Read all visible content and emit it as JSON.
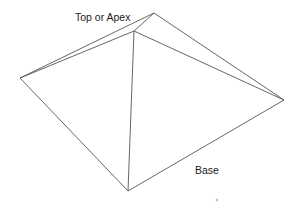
{
  "diagram": {
    "labels": {
      "apex": "Top or Apex",
      "base": "Base"
    },
    "colors": {
      "stroke": "#555555",
      "background": "#ffffff",
      "text": "#222222"
    },
    "vertices": {
      "apex": [
        154,
        13
      ],
      "front_peak": [
        134,
        31
      ],
      "left": [
        20,
        78
      ],
      "right": [
        284,
        100
      ],
      "bottom": [
        128,
        191
      ]
    }
  }
}
